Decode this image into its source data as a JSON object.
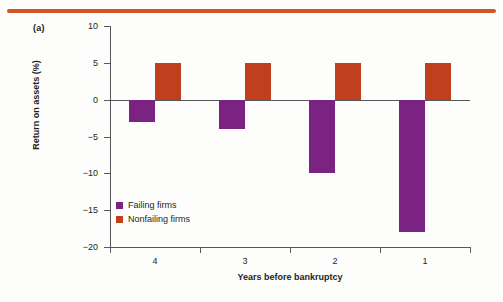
{
  "figure": {
    "panel_label": "(a)",
    "rule_color": "#d4542a"
  },
  "colors": {
    "failing": "#7B2382",
    "nonfailing": "#C0401E",
    "axis": "#58585b",
    "text": "#231f20",
    "background": "#fdfdfc"
  },
  "legend": {
    "position": "inside-bottom-left",
    "items": [
      {
        "label": "Failing firms",
        "color": "#7B2382"
      },
      {
        "label": "Nonfailing firms",
        "color": "#C0401E"
      }
    ]
  },
  "chart_data": {
    "type": "bar",
    "title": "",
    "subtitle": "",
    "xlabel": "Years before bankruptcy",
    "ylabel": "Return on assets (%)",
    "categories": [
      "4",
      "3",
      "2",
      "1"
    ],
    "ylim": [
      -20,
      10
    ],
    "yticks": [
      10,
      5,
      0,
      -5,
      -10,
      -15,
      -20
    ],
    "ytick_labels": [
      "10",
      "5",
      "0",
      "−5",
      "−10",
      "−15",
      "−20"
    ],
    "grid": false,
    "zero_line": true,
    "legend_position": "inside-bottom-left",
    "series": [
      {
        "name": "Failing firms",
        "color": "#7B2382",
        "values": [
          -3,
          -4,
          -10,
          -18
        ]
      },
      {
        "name": "Nonfailing firms",
        "color": "#C0401E",
        "values": [
          5,
          5,
          5,
          5
        ]
      }
    ]
  }
}
